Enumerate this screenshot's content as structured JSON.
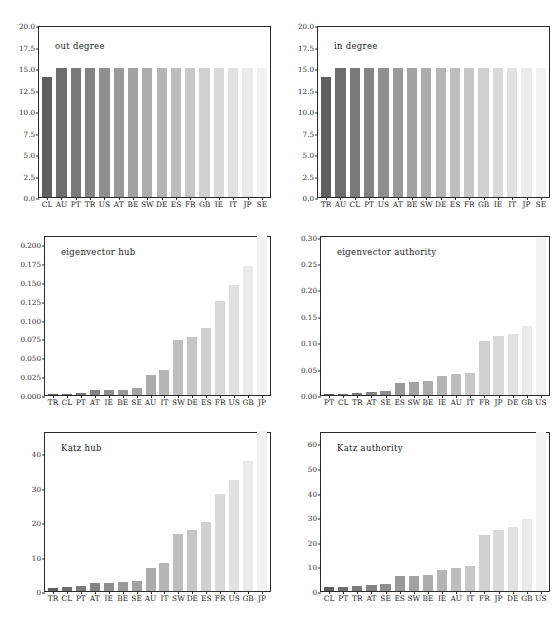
{
  "figure": {
    "width": 558,
    "height": 627,
    "background": "#ffffff",
    "axis_color": "#2b2b2b",
    "bar_dark": "#666666",
    "bar_light": "#f0f0f0"
  },
  "chart_data": [
    {
      "type": "bar",
      "title": "out degree",
      "xlabel": "",
      "ylabel": "",
      "ylim": [
        0,
        20
      ],
      "yticks": [
        "0.0",
        "2.5",
        "5.0",
        "7.5",
        "10.0",
        "12.5",
        "15.0",
        "17.5",
        "20.0"
      ],
      "ytickvalues": [
        0,
        2.5,
        5,
        7.5,
        10,
        12.5,
        15,
        17.5,
        20
      ],
      "grid": false,
      "legend": "none",
      "categories": [
        "CL",
        "AU",
        "PT",
        "TR",
        "US",
        "AT",
        "BE",
        "SW",
        "DE",
        "ES",
        "FR",
        "GB",
        "IE",
        "IT",
        "JP",
        "SE"
      ],
      "values": [
        14,
        15,
        15,
        15,
        15,
        15,
        15,
        15,
        15,
        15,
        15,
        15,
        15,
        15,
        15,
        15
      ]
    },
    {
      "type": "bar",
      "title": "in degree",
      "xlabel": "",
      "ylabel": "",
      "ylim": [
        0,
        20
      ],
      "yticks": [
        "0.0",
        "2.5",
        "5.0",
        "7.5",
        "10.0",
        "12.5",
        "15.0",
        "17.5",
        "20.0"
      ],
      "ytickvalues": [
        0,
        2.5,
        5,
        7.5,
        10,
        12.5,
        15,
        17.5,
        20
      ],
      "grid": false,
      "legend": "none",
      "categories": [
        "TR",
        "AU",
        "CL",
        "PT",
        "US",
        "AT",
        "BE",
        "SW",
        "DE",
        "ES",
        "FR",
        "GB",
        "IE",
        "IT",
        "JP",
        "SE"
      ],
      "values": [
        14,
        15,
        15,
        15,
        15,
        15,
        15,
        15,
        15,
        15,
        15,
        15,
        15,
        15,
        15,
        15
      ]
    },
    {
      "type": "bar",
      "title": "eigenvector hub",
      "xlabel": "",
      "ylabel": "",
      "ylim": [
        0,
        0.212
      ],
      "yticks": [
        "0.000",
        "0.025",
        "0.050",
        "0.075",
        "0.100",
        "0.125",
        "0.150",
        "0.175",
        "0.200"
      ],
      "ytickvalues": [
        0,
        0.025,
        0.05,
        0.075,
        0.1,
        0.125,
        0.15,
        0.175,
        0.2
      ],
      "grid": false,
      "legend": "none",
      "categories": [
        "TR",
        "CL",
        "PT",
        "AT",
        "IE",
        "BE",
        "SE",
        "AU",
        "IT",
        "SW",
        "DE",
        "ES",
        "FR",
        "US",
        "GB",
        "JP"
      ],
      "values": [
        0.0004,
        0.0012,
        0.0025,
        0.0065,
        0.0068,
        0.0072,
        0.0098,
        0.0262,
        0.0325,
        0.0735,
        0.0775,
        0.0885,
        0.1245,
        0.1455,
        0.1715,
        0.2115
      ]
    },
    {
      "type": "bar",
      "title": "eigenvector authority",
      "xlabel": "",
      "ylabel": "",
      "ylim": [
        0,
        0.303
      ],
      "yticks": [
        "0.00",
        "0.05",
        "0.10",
        "0.15",
        "0.20",
        "0.25",
        "0.30"
      ],
      "ytickvalues": [
        0,
        0.05,
        0.1,
        0.15,
        0.2,
        0.25,
        0.3
      ],
      "grid": false,
      "legend": "none",
      "categories": [
        "PT",
        "CL",
        "TR",
        "AT",
        "SE",
        "ES",
        "SW",
        "BE",
        "IE",
        "AU",
        "IT",
        "FR",
        "JP",
        "DE",
        "GB",
        "US"
      ],
      "values": [
        0.0022,
        0.0028,
        0.0045,
        0.0062,
        0.0078,
        0.0232,
        0.0248,
        0.0268,
        0.0352,
        0.0402,
        0.0415,
        0.1015,
        0.1118,
        0.1158,
        0.1302,
        0.2965
      ]
    },
    {
      "type": "bar",
      "title": "Katz hub",
      "xlabel": "",
      "ylabel": "",
      "ylim": [
        0,
        46.5
      ],
      "yticks": [
        "0",
        "10",
        "20",
        "30",
        "40"
      ],
      "ytickvalues": [
        0,
        10,
        20,
        30,
        40
      ],
      "grid": false,
      "legend": "none",
      "categories": [
        "TR",
        "CL",
        "PT",
        "AT",
        "IE",
        "BE",
        "SE",
        "AU",
        "IT",
        "SW",
        "DE",
        "ES",
        "FR",
        "US",
        "GB",
        "JP"
      ],
      "values": [
        0.9,
        1.2,
        1.5,
        2.3,
        2.4,
        2.5,
        2.9,
        6.7,
        8.2,
        16.6,
        17.8,
        20.2,
        28.1,
        32.4,
        37.9,
        46.4
      ]
    },
    {
      "type": "bar",
      "title": "Katz authority",
      "xlabel": "",
      "ylabel": "",
      "ylim": [
        0,
        65
      ],
      "yticks": [
        "0",
        "10",
        "20",
        "30",
        "40",
        "50",
        "60"
      ],
      "ytickvalues": [
        0,
        10,
        20,
        30,
        40,
        50,
        60
      ],
      "grid": false,
      "legend": "none",
      "categories": [
        "CL",
        "PT",
        "TR",
        "AT",
        "SE",
        "ES",
        "SW",
        "BE",
        "IE",
        "AU",
        "IT",
        "FR",
        "JP",
        "DE",
        "GB",
        "US"
      ],
      "values": [
        1.6,
        1.6,
        2.0,
        2.4,
        2.7,
        6.0,
        6.2,
        6.7,
        8.6,
        9.4,
        10.0,
        22.7,
        24.9,
        25.9,
        29.2,
        64.5
      ]
    }
  ],
  "panels": [
    {
      "index": 0,
      "left": 38,
      "top": 26,
      "width": 233,
      "height": 172
    },
    {
      "index": 1,
      "left": 317,
      "top": 26,
      "width": 233,
      "height": 172
    },
    {
      "index": 2,
      "left": 44,
      "top": 236,
      "width": 227,
      "height": 160
    },
    {
      "index": 3,
      "left": 320,
      "top": 236,
      "width": 230,
      "height": 160
    },
    {
      "index": 4,
      "left": 44,
      "top": 432,
      "width": 227,
      "height": 160
    },
    {
      "index": 5,
      "left": 320,
      "top": 432,
      "width": 230,
      "height": 160
    }
  ]
}
